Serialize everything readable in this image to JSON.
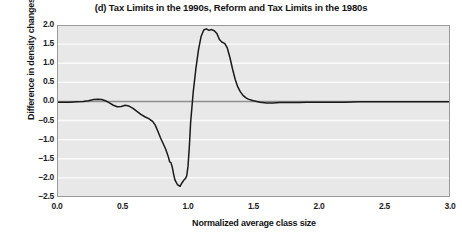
{
  "chart_data": {
    "type": "line",
    "title": "(d) Tax Limits in the 1990s, Reform and Tax Limits in the 1980s",
    "xlabel": "Normalized average class size",
    "ylabel": "Difference in density changes",
    "xlim": [
      0.0,
      3.0
    ],
    "ylim": [
      -2.5,
      2.0
    ],
    "grid": true,
    "legend": "none",
    "xticks": [
      "0.0",
      "0.5",
      "1.0",
      "1.5",
      "2.0",
      "2.5",
      "3.0"
    ],
    "xtick_values": [
      0.0,
      0.5,
      1.0,
      1.5,
      2.0,
      2.5,
      3.0
    ],
    "yticks": [
      "2.0",
      "1.5",
      "1.0",
      "0.5",
      "0.0",
      "-0.5",
      "-1.0",
      "-1.5",
      "-2.0",
      "-2.5"
    ],
    "ytick_values": [
      2.0,
      1.5,
      1.0,
      0.5,
      0.0,
      -0.5,
      -1.0,
      -1.5,
      -2.0,
      -2.5
    ],
    "zero_line": 0.0,
    "series": [
      {
        "name": "Difference in density changes",
        "color": "#1a1a1a",
        "x": [
          0.0,
          0.05,
          0.1,
          0.15,
          0.2,
          0.24,
          0.28,
          0.31,
          0.34,
          0.37,
          0.4,
          0.43,
          0.46,
          0.49,
          0.52,
          0.55,
          0.58,
          0.61,
          0.64,
          0.67,
          0.7,
          0.73,
          0.75,
          0.77,
          0.79,
          0.81,
          0.83,
          0.85,
          0.86,
          0.87,
          0.88,
          0.89,
          0.9,
          0.92,
          0.94,
          0.95,
          0.96,
          0.97,
          0.98,
          0.99,
          1.0,
          1.01,
          1.02,
          1.04,
          1.06,
          1.08,
          1.1,
          1.12,
          1.14,
          1.16,
          1.18,
          1.2,
          1.22,
          1.24,
          1.26,
          1.28,
          1.3,
          1.32,
          1.34,
          1.36,
          1.38,
          1.4,
          1.42,
          1.44,
          1.46,
          1.5,
          1.55,
          1.6,
          1.65,
          1.7,
          1.75,
          1.8,
          1.85,
          1.9,
          1.95,
          2.0,
          2.1,
          2.2,
          2.3,
          2.4,
          2.5,
          2.6,
          2.7,
          2.8,
          2.9,
          3.0
        ],
        "y": [
          -0.02,
          -0.02,
          -0.02,
          -0.01,
          0.0,
          0.02,
          0.05,
          0.06,
          0.05,
          0.02,
          -0.04,
          -0.1,
          -0.14,
          -0.13,
          -0.1,
          -0.12,
          -0.18,
          -0.26,
          -0.34,
          -0.4,
          -0.45,
          -0.52,
          -0.62,
          -0.78,
          -0.95,
          -1.1,
          -1.25,
          -1.45,
          -1.58,
          -1.6,
          -1.72,
          -1.9,
          -2.05,
          -2.18,
          -2.22,
          -2.15,
          -2.1,
          -2.05,
          -2.02,
          -1.95,
          -1.7,
          -1.2,
          -0.55,
          0.25,
          0.85,
          1.35,
          1.7,
          1.87,
          1.9,
          1.86,
          1.88,
          1.85,
          1.78,
          1.62,
          1.55,
          1.52,
          1.4,
          1.15,
          0.85,
          0.58,
          0.38,
          0.25,
          0.16,
          0.1,
          0.06,
          0.02,
          -0.02,
          -0.04,
          -0.04,
          -0.03,
          -0.03,
          -0.03,
          -0.03,
          -0.02,
          -0.02,
          -0.02,
          -0.02,
          -0.02,
          -0.01,
          -0.01,
          -0.01,
          -0.01,
          -0.01,
          -0.01,
          -0.01,
          -0.01
        ]
      }
    ],
    "colors": {
      "plot_background": "#e8e8e8",
      "gridline": "#fbfbfb",
      "zero_reference_line": "#8f8f8f",
      "axis_border": "#9a9a9a",
      "curve": "#1a1a1a",
      "text": "#131313",
      "page_background": "#ffffff"
    }
  }
}
